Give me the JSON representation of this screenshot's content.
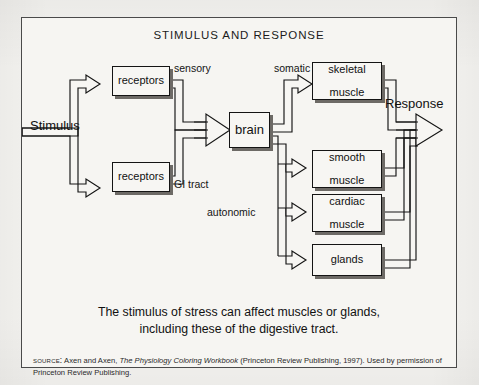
{
  "figure": {
    "title": "STIMULUS AND RESPONSE",
    "caption_line_1": "The stimulus of stress can affect muscles or glands,",
    "caption_line_2": "including these of the digestive tract.",
    "source": {
      "label": "SOURCE:",
      "authors": "Axen and Axen,",
      "work_title": "The Physiology Coloring Workbook",
      "publication": "(Princeton Review Publishing, 1997). Used by",
      "permission": "permission of Princeton Review Publishing."
    }
  },
  "diagram": {
    "type": "flowchart",
    "input_label": "Stimulus",
    "output_label": "Response",
    "nodes": [
      {
        "id": "receptors_top",
        "label": "receptors",
        "line1": "receptors",
        "line2": ""
      },
      {
        "id": "receptors_bottom",
        "label": "receptors",
        "line1": "receptors",
        "line2": ""
      },
      {
        "id": "brain",
        "label": "brain",
        "line1": "brain",
        "line2": ""
      },
      {
        "id": "skeletal_muscle",
        "label": "skeletal muscle",
        "line1": "skeletal",
        "line2": "muscle"
      },
      {
        "id": "smooth_muscle",
        "label": "smooth muscle",
        "line1": "smooth",
        "line2": "muscle"
      },
      {
        "id": "cardiac_muscle",
        "label": "cardiac muscle",
        "line1": "cardiac",
        "line2": "muscle"
      },
      {
        "id": "glands",
        "label": "glands",
        "line1": "glands",
        "line2": ""
      }
    ],
    "pathway_labels": {
      "sensory": "sensory",
      "gi_tract": "GI tract",
      "somatic": "somatic",
      "autonomic": "autonomic"
    }
  },
  "colors": {
    "frame_border": "#4a4a4a",
    "figure_background": "#f6f5f2",
    "box_border": "#141414",
    "box_shadow": "#6d6a66",
    "text": "#111111"
  }
}
